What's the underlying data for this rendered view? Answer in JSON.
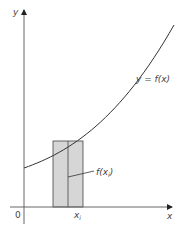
{
  "diagram": {
    "axis_labels": {
      "x": "x",
      "y": "y",
      "origin": "0"
    },
    "curve_label": "y = f(x)",
    "rectangle_label": "f(x",
    "rectangle_label_sub": "i",
    "rectangle_label_close": ")",
    "tick_label": "x",
    "tick_label_sub": "i",
    "colors": {
      "axis": "#555555",
      "curve": "#333333",
      "rect_fill": "#d6d6d6",
      "rect_stroke": "#444444",
      "text": "#444444"
    }
  }
}
